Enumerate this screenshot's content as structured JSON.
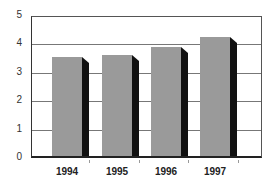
{
  "chart_data": {
    "type": "bar",
    "title": "",
    "xlabel": "",
    "ylabel": "",
    "categories": [
      "1994",
      "1995",
      "1996",
      "1997"
    ],
    "values": [
      3.55,
      3.6,
      3.9,
      4.25
    ],
    "ylim": [
      0,
      5
    ],
    "yticks": [
      "0",
      "1",
      "2",
      "3",
      "4",
      "5"
    ],
    "grid": true,
    "legend": null,
    "style": {
      "bar_color": "#9a9a9a",
      "shadow_color": "#111111",
      "three_d": true
    }
  }
}
